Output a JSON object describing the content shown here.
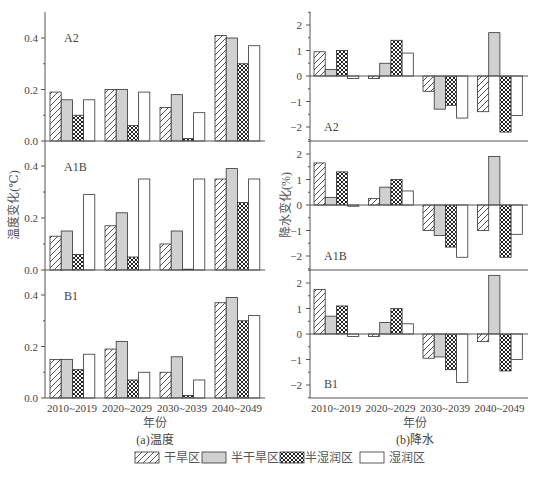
{
  "chart_data": [
    {
      "type": "bar",
      "panel": "a",
      "title": "(a)温度",
      "xlabel": "年份",
      "ylabel": "温度变化(℃)",
      "categories": [
        "2010~2019",
        "2020~2029",
        "2030~2039",
        "2040~2049"
      ],
      "ylim": [
        0,
        0.5
      ],
      "yticks": [
        "0.0",
        "0.2",
        "0.4"
      ],
      "subplots": [
        {
          "scenario": "A2",
          "series": [
            {
              "name": "干旱区",
              "values": [
                0.19,
                0.2,
                0.13,
                0.41
              ]
            },
            {
              "name": "半干旱区",
              "values": [
                0.16,
                0.2,
                0.18,
                0.4
              ]
            },
            {
              "name": "半湿润区",
              "values": [
                0.1,
                0.06,
                0.01,
                0.3
              ]
            },
            {
              "name": "湿润区",
              "values": [
                0.16,
                0.19,
                0.11,
                0.37
              ]
            }
          ]
        },
        {
          "scenario": "A1B",
          "series": [
            {
              "name": "干旱区",
              "values": [
                0.13,
                0.17,
                0.1,
                0.35
              ]
            },
            {
              "name": "半干旱区",
              "values": [
                0.15,
                0.22,
                0.15,
                0.39
              ]
            },
            {
              "name": "半湿润区",
              "values": [
                0.06,
                0.05,
                0.0,
                0.26
              ]
            },
            {
              "name": "湿润区",
              "values": [
                0.29,
                0.35,
                0.35,
                0.35
              ]
            }
          ]
        },
        {
          "scenario": "B1",
          "series": [
            {
              "name": "干旱区",
              "values": [
                0.15,
                0.19,
                0.1,
                0.37
              ]
            },
            {
              "name": "半干旱区",
              "values": [
                0.15,
                0.22,
                0.16,
                0.39
              ]
            },
            {
              "name": "半湿润区",
              "values": [
                0.11,
                0.07,
                0.01,
                0.3
              ]
            },
            {
              "name": "湿润区",
              "values": [
                0.17,
                0.1,
                0.07,
                0.32
              ]
            }
          ]
        }
      ]
    },
    {
      "type": "bar",
      "panel": "b",
      "title": "(b)降水",
      "xlabel": "年份",
      "ylabel": "降水变化(%)",
      "categories": [
        "2010~2019",
        "2020~2029",
        "2030~2039",
        "2040~2049"
      ],
      "ylim": [
        -2.5,
        2.5
      ],
      "yticks": [
        "-2",
        "-1",
        "0",
        "1",
        "2"
      ],
      "subplots": [
        {
          "scenario": "A2",
          "series": [
            {
              "name": "干旱区",
              "values": [
                0.95,
                -0.1,
                -0.6,
                -1.4
              ]
            },
            {
              "name": "半干旱区",
              "values": [
                0.25,
                0.5,
                -1.3,
                1.7
              ]
            },
            {
              "name": "半湿润区",
              "values": [
                1.0,
                1.4,
                -1.15,
                -2.2
              ]
            },
            {
              "name": "湿润区",
              "values": [
                -0.1,
                0.9,
                -1.65,
                -1.55
              ]
            }
          ]
        },
        {
          "scenario": "A1B",
          "series": [
            {
              "name": "干旱区",
              "values": [
                1.65,
                0.25,
                -1.0,
                -1.0
              ]
            },
            {
              "name": "半干旱区",
              "values": [
                0.3,
                0.7,
                -1.2,
                1.9
              ]
            },
            {
              "name": "半湿润区",
              "values": [
                1.3,
                1.0,
                -1.65,
                -2.05
              ]
            },
            {
              "name": "湿润区",
              "values": [
                -0.05,
                0.55,
                -2.05,
                -1.15
              ]
            }
          ]
        },
        {
          "scenario": "B1",
          "series": [
            {
              "name": "干旱区",
              "values": [
                1.75,
                -0.1,
                -0.95,
                -0.3
              ]
            },
            {
              "name": "半干旱区",
              "values": [
                0.7,
                0.45,
                -0.9,
                2.3
              ]
            },
            {
              "name": "半湿润区",
              "values": [
                1.1,
                1.0,
                -1.4,
                -1.45
              ]
            },
            {
              "name": "湿润区",
              "values": [
                -0.1,
                0.4,
                -1.9,
                -1.0
              ]
            }
          ]
        }
      ]
    }
  ],
  "legend": [
    {
      "label": "干旱区",
      "pattern": "hatch"
    },
    {
      "label": "半干旱区",
      "pattern": "gray"
    },
    {
      "label": "半湿润区",
      "pattern": "crosshatch"
    },
    {
      "label": "湿润区",
      "pattern": "white"
    }
  ],
  "colors": {
    "gray_fill": "#d0d0d0",
    "edge": "#333333",
    "axis": "#555555"
  }
}
